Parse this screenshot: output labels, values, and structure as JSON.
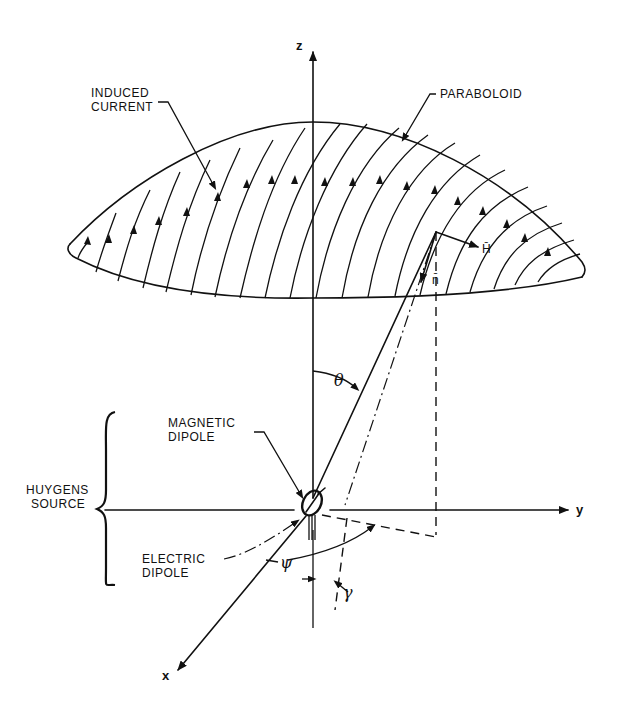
{
  "figure": {
    "labels": {
      "induced_current": [
        "INDUCED",
        "CURRENT"
      ],
      "paraboloid": "PARABOLOID",
      "magnetic_dipole": [
        "MAGNETIC",
        "DIPOLE"
      ],
      "electric_dipole": [
        "ELECTRIC",
        "DIPOLE"
      ],
      "huygens_source": [
        "HUYGENS",
        "SOURCE"
      ],
      "h_vector": "H̄",
      "n_vector": "n̄"
    },
    "axes": {
      "z": "z",
      "y": "y",
      "x": "x"
    },
    "angles": {
      "theta": "θ",
      "psi": "ψ",
      "gamma": "γ"
    },
    "colors": {
      "ink": "#111111",
      "background": "#ffffff"
    }
  }
}
